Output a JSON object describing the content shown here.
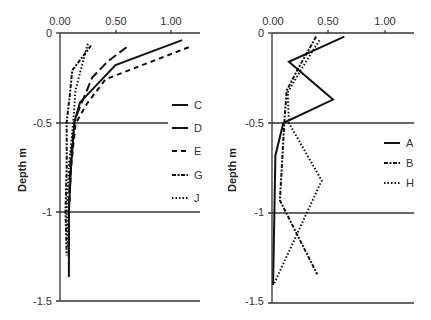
{
  "chart_data": [
    {
      "type": "line",
      "panel": "left",
      "title": "",
      "xlabel": "",
      "ylabel": "Depth m",
      "xlim": [
        0,
        1.2
      ],
      "ylim": [
        -1.5,
        0
      ],
      "x_ticks": [
        "0.00",
        "0.50",
        "1.00"
      ],
      "y_ticks": [
        "0",
        "-0.5",
        "-1",
        "-1.5"
      ],
      "grid": "horizontal lines at y tick positions",
      "legend_position": "right",
      "series": [
        {
          "name": "C",
          "style": "solid",
          "points": [
            [
              1.1,
              -0.04
            ],
            [
              0.5,
              -0.18
            ],
            [
              0.18,
              -0.39
            ],
            [
              0.13,
              -0.5
            ],
            [
              0.1,
              -0.75
            ],
            [
              0.08,
              -1.0
            ],
            [
              0.08,
              -1.37
            ]
          ]
        },
        {
          "name": "D",
          "style": "long-dash",
          "points": [
            [
              0.6,
              -0.08
            ],
            [
              0.43,
              -0.16
            ],
            [
              0.29,
              -0.25
            ],
            [
              0.17,
              -0.43
            ],
            [
              0.13,
              -0.5
            ],
            [
              0.09,
              -0.75
            ],
            [
              0.08,
              -1.0
            ],
            [
              0.08,
              -1.3
            ]
          ]
        },
        {
          "name": "E",
          "style": "short-dash",
          "points": [
            [
              1.16,
              -0.08
            ],
            [
              0.41,
              -0.26
            ],
            [
              0.24,
              -0.4
            ],
            [
              0.14,
              -0.51
            ],
            [
              0.1,
              -0.75
            ],
            [
              0.08,
              -1.0
            ],
            [
              0.08,
              -1.25
            ]
          ]
        },
        {
          "name": "G",
          "style": "dash-dot",
          "points": [
            [
              0.28,
              -0.07
            ],
            [
              0.11,
              -0.21
            ],
            [
              0.09,
              -0.34
            ],
            [
              0.06,
              -0.5
            ],
            [
              0.06,
              -0.75
            ],
            [
              0.05,
              -1.0
            ],
            [
              0.06,
              -1.25
            ]
          ]
        },
        {
          "name": "J",
          "style": "dotted",
          "points": [
            [
              0.25,
              -0.06
            ],
            [
              0.14,
              -0.32
            ],
            [
              0.12,
              -0.5
            ],
            [
              0.08,
              -0.75
            ],
            [
              0.06,
              -1.0
            ],
            [
              0.07,
              -1.2
            ]
          ]
        }
      ]
    },
    {
      "type": "line",
      "panel": "right",
      "title": "",
      "xlabel": "",
      "ylabel": "Depth m",
      "xlim": [
        0,
        1.2
      ],
      "ylim": [
        -1.5,
        0
      ],
      "x_ticks": [
        "0.00",
        "0.50",
        "1.00"
      ],
      "y_ticks": [
        "0",
        "-0.5",
        "-1",
        "-1.5"
      ],
      "grid": "horizontal lines at y tick positions",
      "legend_position": "right",
      "series": [
        {
          "name": "A",
          "style": "solid",
          "points": [
            [
              0.64,
              -0.02
            ],
            [
              0.15,
              -0.16
            ],
            [
              0.54,
              -0.37
            ],
            [
              0.1,
              -0.5
            ],
            [
              0.03,
              -0.68
            ],
            [
              0.01,
              -1.4
            ]
          ]
        },
        {
          "name": "B",
          "style": "dash-dot",
          "points": [
            [
              0.39,
              -0.02
            ],
            [
              0.22,
              -0.21
            ],
            [
              0.13,
              -0.32
            ],
            [
              0.11,
              -0.49
            ],
            [
              0.07,
              -0.93
            ],
            [
              0.4,
              -1.34
            ]
          ]
        },
        {
          "name": "H",
          "style": "dotted",
          "points": [
            [
              0.42,
              -0.04
            ],
            [
              0.25,
              -0.21
            ],
            [
              0.14,
              -0.33
            ],
            [
              0.15,
              -0.5
            ],
            [
              0.44,
              -0.82
            ],
            [
              0.02,
              -1.39
            ]
          ]
        }
      ]
    }
  ],
  "panels": {
    "left": {
      "ylabel": "Depth m",
      "x_ticks": [
        "0.00",
        "0.50",
        "1.00"
      ],
      "y_ticks": [
        "0",
        "-0.5",
        "-1",
        "-1.5"
      ],
      "legend": [
        "C",
        "D",
        "E",
        "G",
        "J"
      ]
    },
    "right": {
      "ylabel": "Depth m",
      "x_ticks": [
        "0.00",
        "0.50",
        "1.00"
      ],
      "y_ticks": [
        "0",
        "-0.5",
        "-1",
        "-1.5"
      ],
      "legend": [
        "A",
        "B",
        "H"
      ]
    }
  },
  "colors": {
    "line": "#111111",
    "axis": "#333333",
    "text": "#333333",
    "background": "#ffffff"
  }
}
